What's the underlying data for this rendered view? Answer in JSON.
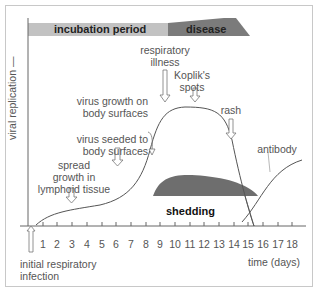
{
  "phases": {
    "incubation": {
      "label": "incubation period",
      "color": "#c0c0c0"
    },
    "disease": {
      "label": "disease",
      "color": "#7a7a7a"
    }
  },
  "axes": {
    "y_label": "viral replication —",
    "x_label": "time (days)",
    "x_ticks": [
      "1",
      "2",
      "3",
      "4",
      "5",
      "6",
      "7",
      "8",
      "9",
      "10",
      "11",
      "12",
      "13",
      "14",
      "15",
      "16",
      "17",
      "18"
    ]
  },
  "events": {
    "initial": "initial respiratory infection",
    "initial_line1": "initial respiratory",
    "initial_line2": "infection",
    "lymphoid_line1": "spread",
    "lymphoid_line2": "growth in",
    "lymphoid_line3": "lymphoid tissue",
    "seeded_line1": "virus seeded to",
    "seeded_line2": "body surfaces",
    "growth_line1": "virus growth on",
    "growth_line2": "body surfaces",
    "resp_line1": "respiratory",
    "resp_line2": "illness",
    "koplik_line1": "Koplik's",
    "koplik_line2": "spots",
    "rash": "rash"
  },
  "curves": {
    "shedding": {
      "label": "shedding",
      "color": "#6e6e6e"
    },
    "antibody": {
      "label": "antibody"
    }
  }
}
